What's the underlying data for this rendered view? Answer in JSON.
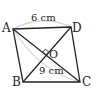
{
  "diagram": {
    "type": "quadrilateral-with-diagonals",
    "vertices": {
      "A": {
        "label": "A",
        "x": 13,
        "y": 29
      },
      "B": {
        "label": "B",
        "x": 23,
        "y": 82
      },
      "C": {
        "label": "C",
        "x": 80,
        "y": 82
      },
      "D": {
        "label": "D",
        "x": 71,
        "y": 27
      }
    },
    "intersection": {
      "label": "O",
      "x": 46,
      "y": 55
    },
    "measurements": {
      "AD": "6 cm",
      "AC": "9 cm"
    },
    "right_angle_at": "O",
    "colors": {
      "line": "#222222",
      "arc": "#c8c8c8"
    }
  }
}
